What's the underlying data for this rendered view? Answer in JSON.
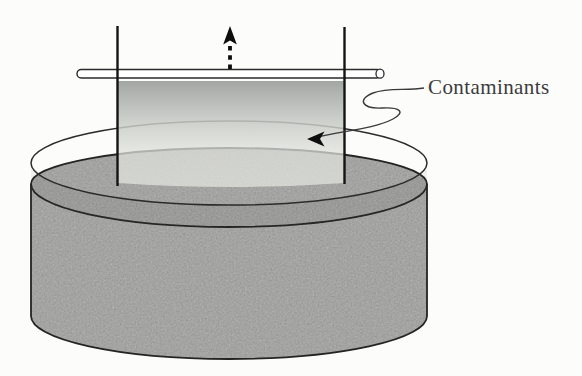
{
  "figure": {
    "type": "scientific-illustration",
    "label": "Contaminants",
    "colors": {
      "background": "#fcfcfb",
      "liquid_gray": "#b6b6b5",
      "surface_band_shade": "rgba(0,0,0,0.045)",
      "plate_top": "#9ea29e",
      "plate_bottom": "#e4e5e0",
      "outline": "#242424",
      "wire": "#141414",
      "rod_fill": "#ffffff",
      "arrow_black": "#0d0d0d",
      "label_text": "#3b3b3b"
    },
    "elements": {
      "dish": "cylindrical glass dish with liquid",
      "rim": "thin elliptical glass rim above liquid level",
      "waterline_arcs": "two dark front arcs at liquid surface",
      "plate": "translucent plate partially submerged, gradient dark top to light bottom",
      "support_rod": "white horizontal cylindrical rod with round end cap",
      "wires": "two vertical support wires at plate edges",
      "pull_arrow": "dashed vertical arrow pointing up (withdrawal direction)",
      "leader": "squiggly leader line from label to surface with arrowhead"
    }
  }
}
